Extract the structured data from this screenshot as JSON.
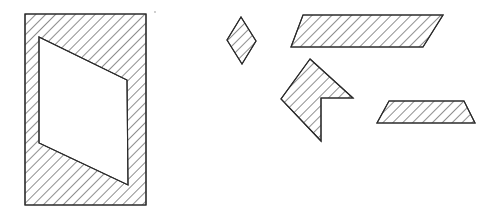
{
  "figure": {
    "background_color": "#ffffff",
    "stroke_color": "#2b2b2b",
    "hatch_color": "#3a3a3a",
    "fill_color": "#ffffff",
    "hatch_angle_deg": 45,
    "hatch_spacing_px": 7,
    "canvas": {
      "width": 495,
      "height": 222
    },
    "shapes": [
      {
        "id": "framed-rectangle",
        "name": "rectangle-with-parallelogram-hole",
        "kind": "polygon-with-hole",
        "outer_points": "25,14 146,14 146,205 25,205",
        "hole_points": "39,37 127,80 128,185 39,143",
        "hatched": true,
        "label": ""
      },
      {
        "id": "small-rhombus",
        "name": "small-rhombus-piece",
        "kind": "polygon",
        "points": "241,17 256,41 242,64 227,40",
        "hatched": true,
        "label": ""
      },
      {
        "id": "top-parallelogram",
        "name": "wide-parallelogram-piece",
        "kind": "polygon",
        "points": "303,15 443,15 423,47 291,47",
        "hatched": true,
        "label": ""
      },
      {
        "id": "chevron",
        "name": "chevron-piece",
        "kind": "polygon",
        "points": "310,59 353,98 321,98 321,141 281,99",
        "hatched": true,
        "label": ""
      },
      {
        "id": "bottom-parallelogram",
        "name": "short-parallelogram-piece",
        "kind": "polygon",
        "points": "389,101 464,101 475,123 377,123",
        "hatched": true,
        "label": ""
      }
    ],
    "marks": [
      {
        "id": "speck",
        "name": "stray-speck",
        "x": 155,
        "y": 12,
        "r": 0.9
      }
    ]
  }
}
